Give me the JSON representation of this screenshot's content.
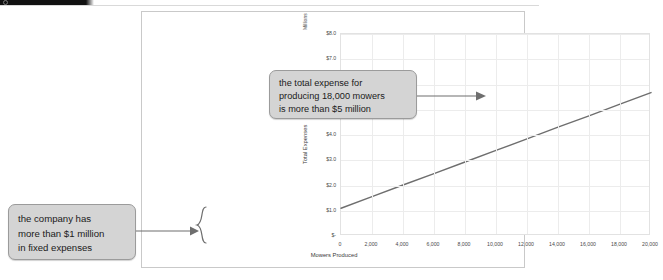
{
  "header": {
    "icon": "circle-icon"
  },
  "chart_data": {
    "type": "line",
    "title": "",
    "xlabel": "Mowers Produced",
    "ylabel": "Total Expenses",
    "y_unit_label": "Millions",
    "xlim": [
      0,
      20000
    ],
    "ylim": [
      0,
      8.0
    ],
    "grid": true,
    "legend": null,
    "x_ticks": [
      "0",
      "2,000",
      "4,000",
      "6,000",
      "8,000",
      "10,000",
      "12,000",
      "14,000",
      "16,000",
      "18,000",
      "20,000"
    ],
    "x_tick_values": [
      0,
      2000,
      4000,
      6000,
      8000,
      10000,
      12000,
      14000,
      16000,
      18000,
      20000
    ],
    "y_ticks": [
      "$-",
      "$1.0",
      "$2.0",
      "$3.0",
      "$4.0",
      "$5.0",
      "$6.0",
      "$7.0",
      "$8.0"
    ],
    "y_tick_values": [
      0,
      1.0,
      2.0,
      3.0,
      4.0,
      5.0,
      6.0,
      7.0,
      8.0
    ],
    "series": [
      {
        "name": "Total Expenses",
        "x": [
          0,
          2000,
          4000,
          6000,
          8000,
          10000,
          12000,
          14000,
          16000,
          18000,
          20000
        ],
        "values": [
          1.1,
          1.56,
          2.02,
          2.47,
          2.93,
          3.39,
          3.85,
          4.31,
          4.76,
          5.22,
          5.68
        ]
      }
    ],
    "annotations": [
      {
        "name": "fixed-expenses-callout",
        "text": "the company has more than $1 million in fixed expenses",
        "lines": [
          "the company has",
          "more than $1 million",
          "in fixed expenses"
        ],
        "points_to": "y-intercept bracket at $0 to $1.1 million"
      },
      {
        "name": "total-expense-callout",
        "text": "the total expense for producing 18,000 mowers is more than $5 million",
        "lines": [
          "the total expense for",
          "producing 18,000 mowers",
          "is more than $5 million"
        ],
        "points_to": "line at x = 18,000"
      }
    ],
    "colors": {
      "line": "#6e6e6e",
      "grid": "#ececec",
      "callout_fill": "#d4d4d4",
      "callout_border": "#9b9b9b",
      "frame": "#c9c9c9"
    }
  }
}
